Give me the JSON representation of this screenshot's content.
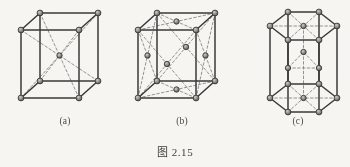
{
  "figure": {
    "caption": "图 2.15",
    "background_color": "#f6f5f1",
    "edge_color": "#3b3a38",
    "dashed_color": "#8a8884",
    "atom_fill": "#8d8b86",
    "atom_stroke": "#36352f",
    "panels": [
      {
        "id": "a",
        "label": "(a)",
        "structure": "body-centered cubic",
        "corner_atoms": 8,
        "interior_atoms": 1,
        "interior_atom_position": "body center"
      },
      {
        "id": "b",
        "label": "(b)",
        "structure": "face-centered cubic",
        "corner_atoms": 8,
        "face_atoms": 6,
        "interior_atoms": 0
      },
      {
        "id": "c",
        "label": "(c)",
        "structure": "hexagonal close-packed",
        "corner_atoms": 12,
        "basal_center_atoms": 2,
        "midplane_atoms": 3
      }
    ]
  },
  "chart_data": {
    "type": "diagram",
    "title": "图 2.15",
    "panels": [
      {
        "label": "(a)",
        "name": "body-centered cubic",
        "projection": "oblique cabinet",
        "cube_front_face": {
          "top_left": [
            21,
            30
          ],
          "top_right": [
            79,
            30
          ],
          "bottom_right": [
            79,
            98
          ],
          "bottom_left": [
            21,
            98
          ]
        },
        "depth_offset": [
          19,
          -17
        ],
        "nodes": [
          {
            "id": "fbl",
            "x": 21,
            "y": 98,
            "type": "corner"
          },
          {
            "id": "fbr",
            "x": 79,
            "y": 98,
            "type": "corner"
          },
          {
            "id": "ftl",
            "x": 21,
            "y": 30,
            "type": "corner"
          },
          {
            "id": "ftr",
            "x": 79,
            "y": 30,
            "type": "corner"
          },
          {
            "id": "rbl",
            "x": 40,
            "y": 81,
            "type": "corner"
          },
          {
            "id": "rbr",
            "x": 98,
            "y": 81,
            "type": "corner"
          },
          {
            "id": "rtl",
            "x": 40,
            "y": 13,
            "type": "corner"
          },
          {
            "id": "rtr",
            "x": 98,
            "y": 13,
            "type": "corner"
          },
          {
            "id": "ctr",
            "x": 59.5,
            "y": 55.5,
            "type": "body-center"
          }
        ],
        "solid_edges": [
          [
            "ftl",
            "ftr"
          ],
          [
            "ftr",
            "fbr"
          ],
          [
            "fbr",
            "fbl"
          ],
          [
            "fbl",
            "ftl"
          ],
          [
            "rtl",
            "rtr"
          ],
          [
            "rtr",
            "rbr"
          ],
          [
            "rbr",
            "rbl"
          ],
          [
            "rbl",
            "rtl"
          ],
          [
            "ftl",
            "rtl"
          ],
          [
            "ftr",
            "rtr"
          ],
          [
            "fbr",
            "rbr"
          ],
          [
            "fbl",
            "rbl"
          ]
        ],
        "dashed_edges": [
          [
            "ftl",
            "ctr"
          ],
          [
            "ftr",
            "ctr"
          ],
          [
            "fbl",
            "ctr"
          ],
          [
            "fbr",
            "ctr"
          ],
          [
            "rtl",
            "ctr"
          ],
          [
            "rtr",
            "ctr"
          ],
          [
            "rbl",
            "ctr"
          ],
          [
            "rbr",
            "ctr"
          ]
        ]
      },
      {
        "label": "(b)",
        "name": "face-centered cubic",
        "projection": "oblique cabinet",
        "cube_front_face": {
          "top_left": [
            138,
            30
          ],
          "top_right": [
            196,
            30
          ],
          "bottom_right": [
            196,
            98
          ],
          "bottom_left": [
            138,
            98
          ]
        },
        "depth_offset": [
          19,
          -17
        ],
        "nodes": [
          {
            "id": "fbl",
            "x": 138,
            "y": 98,
            "type": "corner"
          },
          {
            "id": "fbr",
            "x": 196,
            "y": 98,
            "type": "corner"
          },
          {
            "id": "ftl",
            "x": 138,
            "y": 30,
            "type": "corner"
          },
          {
            "id": "ftr",
            "x": 196,
            "y": 30,
            "type": "corner"
          },
          {
            "id": "rbl",
            "x": 157,
            "y": 81,
            "type": "corner"
          },
          {
            "id": "rbr",
            "x": 215,
            "y": 81,
            "type": "corner"
          },
          {
            "id": "rtl",
            "x": 157,
            "y": 13,
            "type": "corner"
          },
          {
            "id": "rtr",
            "x": 215,
            "y": 13,
            "type": "corner"
          },
          {
            "id": "fcF",
            "x": 167,
            "y": 64,
            "type": "face-center",
            "face": "front"
          },
          {
            "id": "fcK",
            "x": 186,
            "y": 47,
            "type": "face-center",
            "face": "back"
          },
          {
            "id": "fcT",
            "x": 176.5,
            "y": 21.5,
            "type": "face-center",
            "face": "top"
          },
          {
            "id": "fcB",
            "x": 176.5,
            "y": 89.5,
            "type": "face-center",
            "face": "bottom"
          },
          {
            "id": "fcL",
            "x": 147.5,
            "y": 55.5,
            "type": "face-center",
            "face": "left"
          },
          {
            "id": "fcR",
            "x": 205.5,
            "y": 55.5,
            "type": "face-center",
            "face": "right"
          }
        ],
        "solid_edges": [
          [
            "ftl",
            "ftr"
          ],
          [
            "ftr",
            "fbr"
          ],
          [
            "fbr",
            "fbl"
          ],
          [
            "fbl",
            "ftl"
          ],
          [
            "rtl",
            "rtr"
          ],
          [
            "rtr",
            "rbr"
          ],
          [
            "rbr",
            "rbl"
          ],
          [
            "rbl",
            "rtl"
          ],
          [
            "ftl",
            "rtl"
          ],
          [
            "ftr",
            "rtr"
          ],
          [
            "fbr",
            "rbr"
          ],
          [
            "fbl",
            "rbl"
          ]
        ],
        "dashed_edges": [
          [
            "ftl",
            "fcF"
          ],
          [
            "ftr",
            "fcF"
          ],
          [
            "fbl",
            "fcF"
          ],
          [
            "fbr",
            "fcF"
          ],
          [
            "rtl",
            "fcK"
          ],
          [
            "rtr",
            "fcK"
          ],
          [
            "rbl",
            "fcK"
          ],
          [
            "rbr",
            "fcK"
          ],
          [
            "ftl",
            "fcT"
          ],
          [
            "ftr",
            "fcT"
          ],
          [
            "rtl",
            "fcT"
          ],
          [
            "rtr",
            "fcT"
          ],
          [
            "fbl",
            "fcB"
          ],
          [
            "fbr",
            "fcB"
          ],
          [
            "rbl",
            "fcB"
          ],
          [
            "rbr",
            "fcB"
          ],
          [
            "ftl",
            "fcL"
          ],
          [
            "fbl",
            "fcL"
          ],
          [
            "rtl",
            "fcL"
          ],
          [
            "rbl",
            "fcL"
          ],
          [
            "ftr",
            "fcR"
          ],
          [
            "fbr",
            "fcR"
          ],
          [
            "rtr",
            "fcR"
          ],
          [
            "rbr",
            "fcR"
          ]
        ]
      },
      {
        "label": "(c)",
        "name": "hexagonal close-packed",
        "projection": "oblique",
        "nodes": [
          {
            "id": "t0",
            "x": 288,
            "y": 12,
            "type": "corner",
            "layer": "top"
          },
          {
            "id": "t1",
            "x": 319,
            "y": 12,
            "type": "corner",
            "layer": "top"
          },
          {
            "id": "t2",
            "x": 337,
            "y": 26,
            "type": "corner",
            "layer": "top"
          },
          {
            "id": "t3",
            "x": 319,
            "y": 40,
            "type": "corner",
            "layer": "top"
          },
          {
            "id": "t4",
            "x": 288,
            "y": 40,
            "type": "corner",
            "layer": "top"
          },
          {
            "id": "t5",
            "x": 270,
            "y": 26,
            "type": "corner",
            "layer": "top"
          },
          {
            "id": "tc",
            "x": 303.5,
            "y": 26,
            "type": "basal-center",
            "layer": "top"
          },
          {
            "id": "b0",
            "x": 288,
            "y": 84,
            "type": "corner",
            "layer": "bottom"
          },
          {
            "id": "b1",
            "x": 319,
            "y": 84,
            "type": "corner",
            "layer": "bottom"
          },
          {
            "id": "b2",
            "x": 337,
            "y": 98,
            "type": "corner",
            "layer": "bottom"
          },
          {
            "id": "b3",
            "x": 319,
            "y": 112,
            "type": "corner",
            "layer": "bottom"
          },
          {
            "id": "b4",
            "x": 288,
            "y": 112,
            "type": "corner",
            "layer": "bottom"
          },
          {
            "id": "b5",
            "x": 270,
            "y": 98,
            "type": "corner",
            "layer": "bottom"
          },
          {
            "id": "bc",
            "x": 303.5,
            "y": 98,
            "type": "basal-center",
            "layer": "bottom"
          },
          {
            "id": "m0",
            "x": 303.5,
            "y": 52,
            "type": "midplane",
            "layer": "middle"
          },
          {
            "id": "m1",
            "x": 288,
            "y": 68,
            "type": "midplane",
            "layer": "middle"
          },
          {
            "id": "m2",
            "x": 319,
            "y": 68,
            "type": "midplane",
            "layer": "middle"
          }
        ],
        "solid_edges": [
          [
            "t0",
            "t1"
          ],
          [
            "t1",
            "t2"
          ],
          [
            "t2",
            "t3"
          ],
          [
            "t3",
            "t4"
          ],
          [
            "t4",
            "t5"
          ],
          [
            "t5",
            "t0"
          ],
          [
            "b0",
            "b1"
          ],
          [
            "b1",
            "b2"
          ],
          [
            "b2",
            "b3"
          ],
          [
            "b3",
            "b4"
          ],
          [
            "b4",
            "b5"
          ],
          [
            "b5",
            "b0"
          ],
          [
            "t0",
            "b0"
          ],
          [
            "t1",
            "b1"
          ],
          [
            "t2",
            "b2"
          ],
          [
            "t3",
            "b3"
          ],
          [
            "t4",
            "b4"
          ],
          [
            "t5",
            "b5"
          ]
        ],
        "dashed_edges": [
          [
            "t0",
            "tc"
          ],
          [
            "t1",
            "tc"
          ],
          [
            "t2",
            "tc"
          ],
          [
            "t3",
            "tc"
          ],
          [
            "t4",
            "tc"
          ],
          [
            "t5",
            "tc"
          ],
          [
            "b0",
            "bc"
          ],
          [
            "b1",
            "bc"
          ],
          [
            "b2",
            "bc"
          ],
          [
            "b3",
            "bc"
          ],
          [
            "b4",
            "bc"
          ],
          [
            "b5",
            "bc"
          ],
          [
            "m0",
            "m1"
          ],
          [
            "m1",
            "m2"
          ],
          [
            "m2",
            "m0"
          ],
          [
            "tc",
            "m0"
          ],
          [
            "m0",
            "bc"
          ]
        ]
      }
    ]
  }
}
